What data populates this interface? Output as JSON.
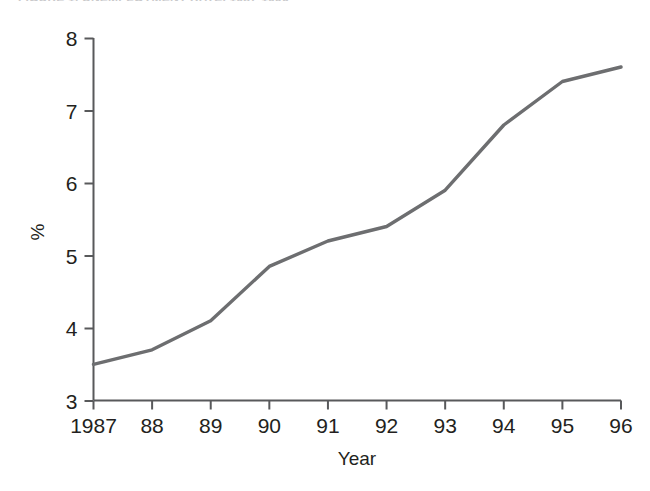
{
  "figure": {
    "cropped_header_text": "FIGURE 1. UNEMPLOYMENT RATE, 1987-1996",
    "axis_color": "#58595b",
    "line_color": "#6d6e70",
    "background": "#ffffff"
  },
  "chart_data": {
    "type": "line",
    "title": "",
    "xlabel": "Year",
    "ylabel": "%",
    "categories": [
      "1987",
      "88",
      "89",
      "90",
      "91",
      "92",
      "93",
      "94",
      "95",
      "96"
    ],
    "x": [
      1987,
      1988,
      1989,
      1990,
      1991,
      1992,
      1993,
      1994,
      1995,
      1996
    ],
    "values": [
      3.5,
      3.7,
      4.1,
      4.85,
      5.2,
      5.4,
      5.9,
      6.8,
      7.4,
      7.6
    ],
    "series": [
      {
        "name": "Rate",
        "values": [
          3.5,
          3.7,
          4.1,
          4.85,
          5.2,
          5.4,
          5.9,
          6.8,
          7.4,
          7.6
        ]
      }
    ],
    "ylim": [
      3,
      8
    ],
    "yticks": [
      3,
      4,
      5,
      6,
      7,
      8
    ],
    "yticklabels": [
      "3",
      "4",
      "5",
      "6",
      "7",
      "8"
    ],
    "xlim": [
      1987,
      1996
    ],
    "grid": false,
    "legend": false,
    "legend_position": "none"
  }
}
